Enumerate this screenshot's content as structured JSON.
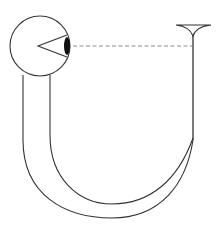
{
  "diagram": {
    "title": "Eye looking through a U-shaped tube",
    "elements": [
      {
        "id": "eyeball",
        "label": "Eyeball"
      },
      {
        "id": "lens",
        "label": "Lens"
      },
      {
        "id": "sight-line",
        "label": "Line of sight (dashed)"
      },
      {
        "id": "funnel",
        "label": "Funnel opening"
      },
      {
        "id": "u-tube",
        "label": "Curved U-tube"
      }
    ],
    "colors": {
      "stroke": "#333333",
      "lens": "#111111",
      "dash": "#888888",
      "background": "#ffffff"
    }
  }
}
